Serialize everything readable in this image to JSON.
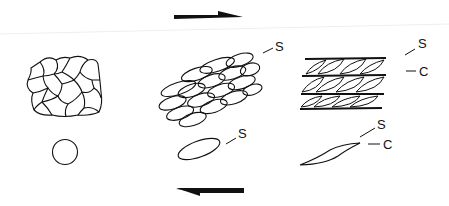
{
  "diagram": {
    "type": "shear fabric development",
    "shear_sense": "dextral",
    "arrows": {
      "top": {
        "direction": "right"
      },
      "bottom": {
        "direction": "left"
      }
    },
    "stages": [
      {
        "name": "undeformed",
        "aggregate": "equant-grains",
        "marker": "circle",
        "labels": []
      },
      {
        "name": "s-fabric",
        "aggregate": "elongated-grains",
        "marker": "ellipse",
        "labels": [
          "S"
        ]
      },
      {
        "name": "s-c-fabric",
        "aggregate": "sheared-bands",
        "marker": "sigmoid",
        "labels": [
          "S",
          "C"
        ]
      }
    ],
    "labels": {
      "s1": "S",
      "s2_top": "S",
      "c2_top": "C",
      "s_marker_mid": "S",
      "s_marker_right": "S",
      "c_marker_right": "C"
    },
    "colors": {
      "line": "#111111",
      "background": "#ffffff"
    }
  }
}
